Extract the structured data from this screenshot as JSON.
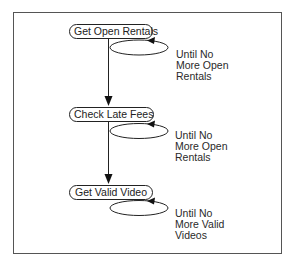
{
  "diagram": {
    "type": "flow",
    "frame": {
      "border_color": "#555555"
    },
    "nodes": [
      {
        "id": "n1",
        "label": "Get Open Rentals"
      },
      {
        "id": "n2",
        "label": "Check Late Fees"
      },
      {
        "id": "n3",
        "label": "Get Valid Video"
      }
    ],
    "edges": [
      {
        "from": "n1",
        "to": "n2",
        "type": "arrow"
      },
      {
        "from": "n2",
        "to": "n3",
        "type": "arrow"
      }
    ],
    "loops": [
      {
        "node": "n1",
        "lines": [
          "Until No",
          "More Open",
          "Rentals"
        ]
      },
      {
        "node": "n2",
        "lines": [
          "Until No",
          "More Open",
          "Rentals"
        ]
      },
      {
        "node": "n3",
        "lines": [
          "Until No",
          "More Valid",
          "Videos"
        ]
      }
    ]
  }
}
